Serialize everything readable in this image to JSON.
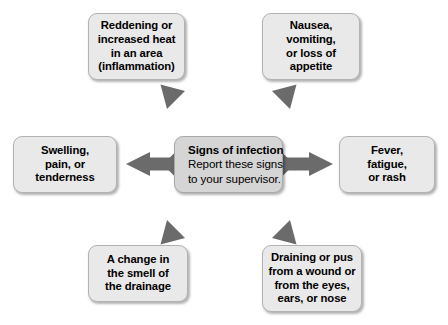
{
  "diagram": {
    "type": "radial-spider",
    "background_color": "#ffffff",
    "arrow_color": "#6b6b6b",
    "node_fill": "#e9e9e9",
    "node_border": "#b2b2b2",
    "center_fill": "#d5d5d5",
    "center": {
      "title": "Signs of infection",
      "body_lines": [
        "Report these signs",
        "to your supervisor."
      ]
    },
    "nodes": [
      {
        "id": "top-left",
        "position": "top-left",
        "lines": [
          "Reddening or",
          "increased heat",
          "in an area",
          "(inflammation)"
        ]
      },
      {
        "id": "top-right",
        "position": "top-right",
        "lines": [
          "Nausea,",
          "vomiting,",
          "or loss of",
          "appetite"
        ]
      },
      {
        "id": "left",
        "position": "left",
        "lines": [
          "Swelling,",
          "pain, or",
          "tenderness"
        ]
      },
      {
        "id": "right",
        "position": "right",
        "lines": [
          "Fever,",
          "fatigue,",
          "or rash"
        ]
      },
      {
        "id": "bottom-left",
        "position": "bottom-left",
        "lines": [
          "A change in",
          "the smell of",
          "the drainage"
        ]
      },
      {
        "id": "bottom-right",
        "position": "bottom-right",
        "lines": [
          "Draining or pus",
          "from a wound or",
          "from the eyes,",
          "ears, or nose"
        ]
      }
    ],
    "arrows": [
      {
        "id": "arrow-to-top-left",
        "direction": "up-left"
      },
      {
        "id": "arrow-to-top-right",
        "direction": "up-right"
      },
      {
        "id": "arrow-to-left",
        "direction": "left"
      },
      {
        "id": "arrow-to-right",
        "direction": "right"
      },
      {
        "id": "arrow-to-bottom-left",
        "direction": "down-left"
      },
      {
        "id": "arrow-to-bottom-right",
        "direction": "down-right"
      }
    ]
  }
}
